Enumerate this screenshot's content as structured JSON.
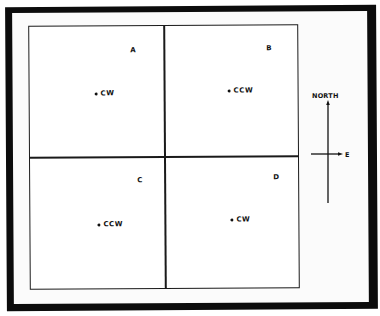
{
  "diagram": {
    "type": "quadrant-rotation-map",
    "quadrants": [
      {
        "id": "A",
        "label": "A",
        "rotation": "CW"
      },
      {
        "id": "B",
        "label": "B",
        "rotation": "CCW"
      },
      {
        "id": "C",
        "label": "C",
        "rotation": "CCW"
      },
      {
        "id": "D",
        "label": "D",
        "rotation": "CW"
      }
    ],
    "compass": {
      "north_label": "NORTH",
      "east_label": "E"
    },
    "colors": {
      "ink": "#111111",
      "border": "#0c0c0c",
      "background": "#ffffff"
    }
  }
}
